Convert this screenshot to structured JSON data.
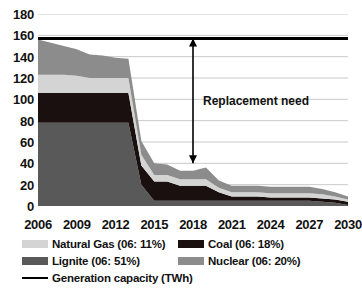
{
  "chart_data": {
    "type": "area",
    "stacked": true,
    "title": "",
    "xlabel": "",
    "ylabel": "",
    "ylim": [
      0,
      180
    ],
    "ytick_values": [
      0,
      20,
      40,
      60,
      80,
      100,
      120,
      140,
      160,
      180
    ],
    "ytick_labels": [
      "0",
      "20",
      "40",
      "60",
      "80",
      "100",
      "120",
      "140",
      "160",
      "180"
    ],
    "grid": true,
    "grid_axis": "y",
    "legend_position": "bottom",
    "x": [
      2006,
      2007,
      2008,
      2009,
      2010,
      2011,
      2012,
      2013,
      2014,
      2015,
      2016,
      2017,
      2018,
      2019,
      2020,
      2021,
      2022,
      2023,
      2024,
      2025,
      2026,
      2027,
      2028,
      2029,
      2030
    ],
    "xtick_values": [
      2006,
      2009,
      2012,
      2015,
      2018,
      2021,
      2024,
      2027,
      2030
    ],
    "xtick_labels": [
      "2006",
      "2009",
      "2012",
      "2015",
      "2018",
      "2021",
      "2024",
      "2027",
      "2030"
    ],
    "stack_order": [
      "Lignite",
      "Coal",
      "Natural Gas",
      "Nuclear"
    ],
    "series": [
      {
        "name": "Lignite (06: 51%)",
        "short_name": "Lignite",
        "color": "#595959",
        "values": [
          78,
          78,
          78,
          78,
          78,
          78,
          78,
          78,
          20,
          5,
          5,
          5,
          5,
          5,
          5,
          5,
          5,
          5,
          5,
          5,
          5,
          5,
          4,
          3,
          1
        ]
      },
      {
        "name": "Coal (06: 18%)",
        "short_name": "Coal",
        "color": "#1a1010",
        "values": [
          28,
          28,
          28,
          28,
          28,
          28,
          28,
          28,
          18,
          18,
          18,
          14,
          14,
          14,
          8,
          4,
          4,
          4,
          3,
          3,
          3,
          3,
          3,
          3,
          3
        ]
      },
      {
        "name": "Natural Gas (06: 11%)",
        "short_name": "Natural Gas",
        "color": "#d4d4d4",
        "values": [
          17,
          17,
          17,
          16,
          14,
          14,
          14,
          14,
          10,
          6,
          6,
          6,
          6,
          6,
          4,
          4,
          4,
          4,
          4,
          4,
          4,
          4,
          4,
          3,
          2
        ]
      },
      {
        "name": "Nuclear (06: 20%)",
        "short_name": "Nuclear",
        "color": "#8c8c8c",
        "values": [
          33,
          30,
          27,
          25,
          22,
          21,
          19,
          18,
          13,
          11,
          10,
          8,
          8,
          11,
          7,
          6,
          6,
          6,
          6,
          6,
          6,
          6,
          5,
          4,
          3
        ]
      }
    ],
    "reference_line": {
      "name": "Generation capacity (TWh)",
      "color": "#000000",
      "value": 157,
      "label": "Generation capacity (TWh)"
    },
    "annotations": [
      {
        "text": "Replacement need",
        "type": "double-arrow",
        "x": 2018,
        "y_top": 157,
        "y_bottom": 40
      }
    ]
  },
  "legend": {
    "rows": [
      [
        {
          "label": "Natural Gas (06: 11%)",
          "color": "#d4d4d4",
          "kind": "swatch"
        },
        {
          "label": "Coal (06: 18%)",
          "color": "#1a1010",
          "kind": "swatch"
        }
      ],
      [
        {
          "label": "Lignite (06: 51%)",
          "color": "#595959",
          "kind": "swatch"
        },
        {
          "label": "Nuclear (06: 20%)",
          "color": "#8c8c8c",
          "kind": "swatch"
        }
      ],
      [
        {
          "label": "Generation capacity (TWh)",
          "color": "#000000",
          "kind": "line"
        }
      ]
    ]
  },
  "annotation": {
    "replacement_need": "Replacement need"
  }
}
